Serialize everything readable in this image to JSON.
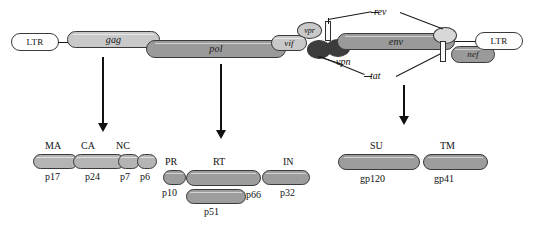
{
  "figure": {
    "genome_row_label": "HIV-1 proviral genome",
    "product_row_label": "Processed viral proteins"
  },
  "genome": {
    "ltr_left": {
      "label": "LTR",
      "fill": "#fdfdfd"
    },
    "gag": {
      "label": "gag",
      "fill": "#c9c9c9"
    },
    "pol": {
      "label": "pol",
      "fill": "#9a9a9a"
    },
    "vif": {
      "label": "vif",
      "fill": "#c9c9c9"
    },
    "vpr": {
      "label": "vpr",
      "fill": "#c9c9c9"
    },
    "vpu_blob1": {
      "label": "",
      "fill": "#3c3c3c"
    },
    "vpu_blob2": {
      "label": "",
      "fill": "#3c3c3c"
    },
    "env": {
      "label": "env",
      "fill": "#9a9a9a"
    },
    "rev_blob": {
      "label": "",
      "fill": "#d8d8d8"
    },
    "nef": {
      "label": "nef",
      "fill": "#9a9a9a"
    },
    "ltr_right": {
      "label": "LTR",
      "fill": "#fdfdfd"
    }
  },
  "regulatory_labels": {
    "rev": "rev",
    "tat": "tat",
    "vpn": "vpn"
  },
  "products": {
    "gag_group": {
      "items": [
        {
          "name": "MA",
          "size": "p17"
        },
        {
          "name": "CA",
          "size": "p24"
        },
        {
          "name": "NC",
          "size": "p7"
        },
        {
          "name": "",
          "size": "p6"
        }
      ]
    },
    "pol_group": {
      "items": [
        {
          "name": "PR",
          "size": "p10"
        },
        {
          "name": "RT",
          "size": "p66"
        },
        {
          "name": "IN",
          "size": "p32"
        }
      ],
      "extra": {
        "name": "",
        "size": "p51"
      }
    },
    "env_group": {
      "items": [
        {
          "name": "SU",
          "size": "gp120"
        },
        {
          "name": "TM",
          "size": "gp41"
        }
      ]
    }
  },
  "arrows": {
    "gag_arrow_name": "gag-processing-arrow",
    "pol_arrow_name": "pol-processing-arrow",
    "env_arrow_name": "env-processing-arrow"
  }
}
